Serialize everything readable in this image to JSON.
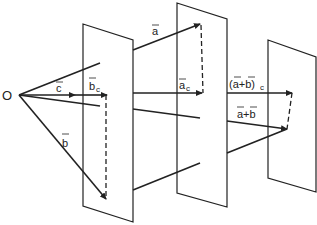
{
  "diagram": {
    "origin_label": "O",
    "labels": {
      "c": "c",
      "b_c": "b",
      "b_c_sub": "c",
      "b": "b",
      "a": "a",
      "a_c": "a",
      "a_c_sub": "c",
      "sum_c": "(a+b)",
      "sum_c_sub": "c",
      "sum": "a+b"
    },
    "colors": {
      "ink": "#222222",
      "background": "#ffffff"
    }
  }
}
